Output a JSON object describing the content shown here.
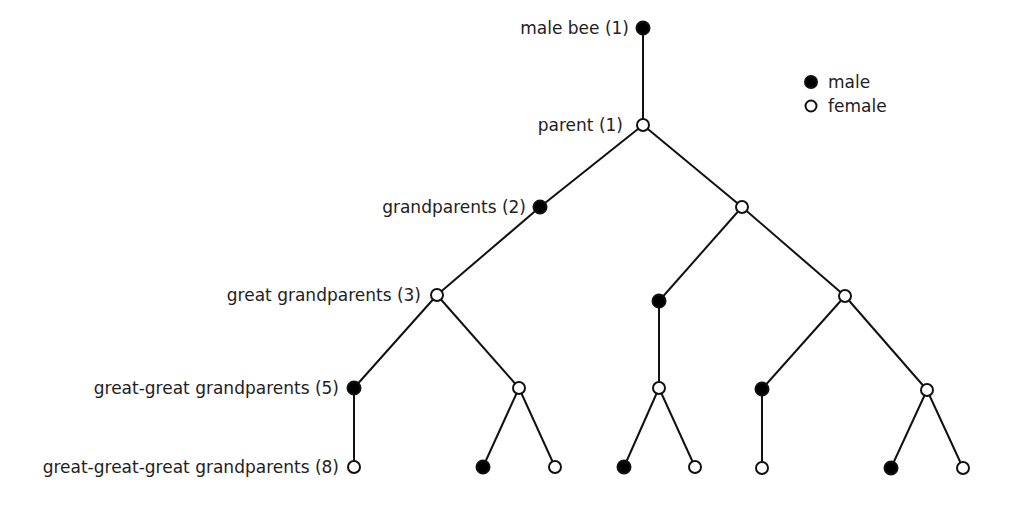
{
  "diagram": {
    "levels": [
      {
        "label": "male bee (1)",
        "y": 28,
        "label_right": 629
      },
      {
        "label": "parent (1)",
        "y": 125,
        "label_right": 623
      },
      {
        "label": "grandparents (2)",
        "y": 207,
        "label_right": 526
      },
      {
        "label": "great grandparents (3)",
        "y": 295,
        "label_right": 421
      },
      {
        "label": "great-great grandparents (5)",
        "y": 388,
        "label_right": 339
      },
      {
        "label": "great-great-great grandparents (8)",
        "y": 467,
        "label_right": 339
      }
    ],
    "legend": {
      "male": "male",
      "female": "female"
    },
    "colors": {
      "male_fill": "#000000",
      "female_fill": "#ffffff",
      "stroke": "#111111"
    },
    "nodes": [
      {
        "id": "n0",
        "x": 643,
        "y": 28,
        "sex": "male"
      },
      {
        "id": "n1",
        "x": 643,
        "y": 125,
        "sex": "female",
        "parent": "n0"
      },
      {
        "id": "n2",
        "x": 540,
        "y": 207,
        "sex": "male",
        "parent": "n1"
      },
      {
        "id": "n3",
        "x": 742,
        "y": 207,
        "sex": "female",
        "parent": "n1"
      },
      {
        "id": "n4",
        "x": 437,
        "y": 295,
        "sex": "female",
        "parent": "n2"
      },
      {
        "id": "n5",
        "x": 659,
        "y": 301,
        "sex": "male",
        "parent": "n3"
      },
      {
        "id": "n6",
        "x": 845,
        "y": 296,
        "sex": "female",
        "parent": "n3"
      },
      {
        "id": "n7",
        "x": 354,
        "y": 388,
        "sex": "male",
        "parent": "n4"
      },
      {
        "id": "n8",
        "x": 519,
        "y": 388,
        "sex": "female",
        "parent": "n4"
      },
      {
        "id": "n9",
        "x": 659,
        "y": 388,
        "sex": "female",
        "parent": "n5"
      },
      {
        "id": "n10",
        "x": 762,
        "y": 389,
        "sex": "male",
        "parent": "n6"
      },
      {
        "id": "n11",
        "x": 927,
        "y": 390,
        "sex": "female",
        "parent": "n6"
      },
      {
        "id": "n12",
        "x": 354,
        "y": 467,
        "sex": "female",
        "parent": "n7"
      },
      {
        "id": "n13",
        "x": 483,
        "y": 467,
        "sex": "male",
        "parent": "n8"
      },
      {
        "id": "n14",
        "x": 555,
        "y": 467,
        "sex": "female",
        "parent": "n8"
      },
      {
        "id": "n15",
        "x": 624,
        "y": 467,
        "sex": "male",
        "parent": "n9"
      },
      {
        "id": "n16",
        "x": 695,
        "y": 467,
        "sex": "female",
        "parent": "n9"
      },
      {
        "id": "n17",
        "x": 762,
        "y": 468,
        "sex": "female",
        "parent": "n10"
      },
      {
        "id": "n18",
        "x": 891,
        "y": 468,
        "sex": "male",
        "parent": "n11"
      },
      {
        "id": "n19",
        "x": 963,
        "y": 468,
        "sex": "female",
        "parent": "n11"
      }
    ]
  }
}
